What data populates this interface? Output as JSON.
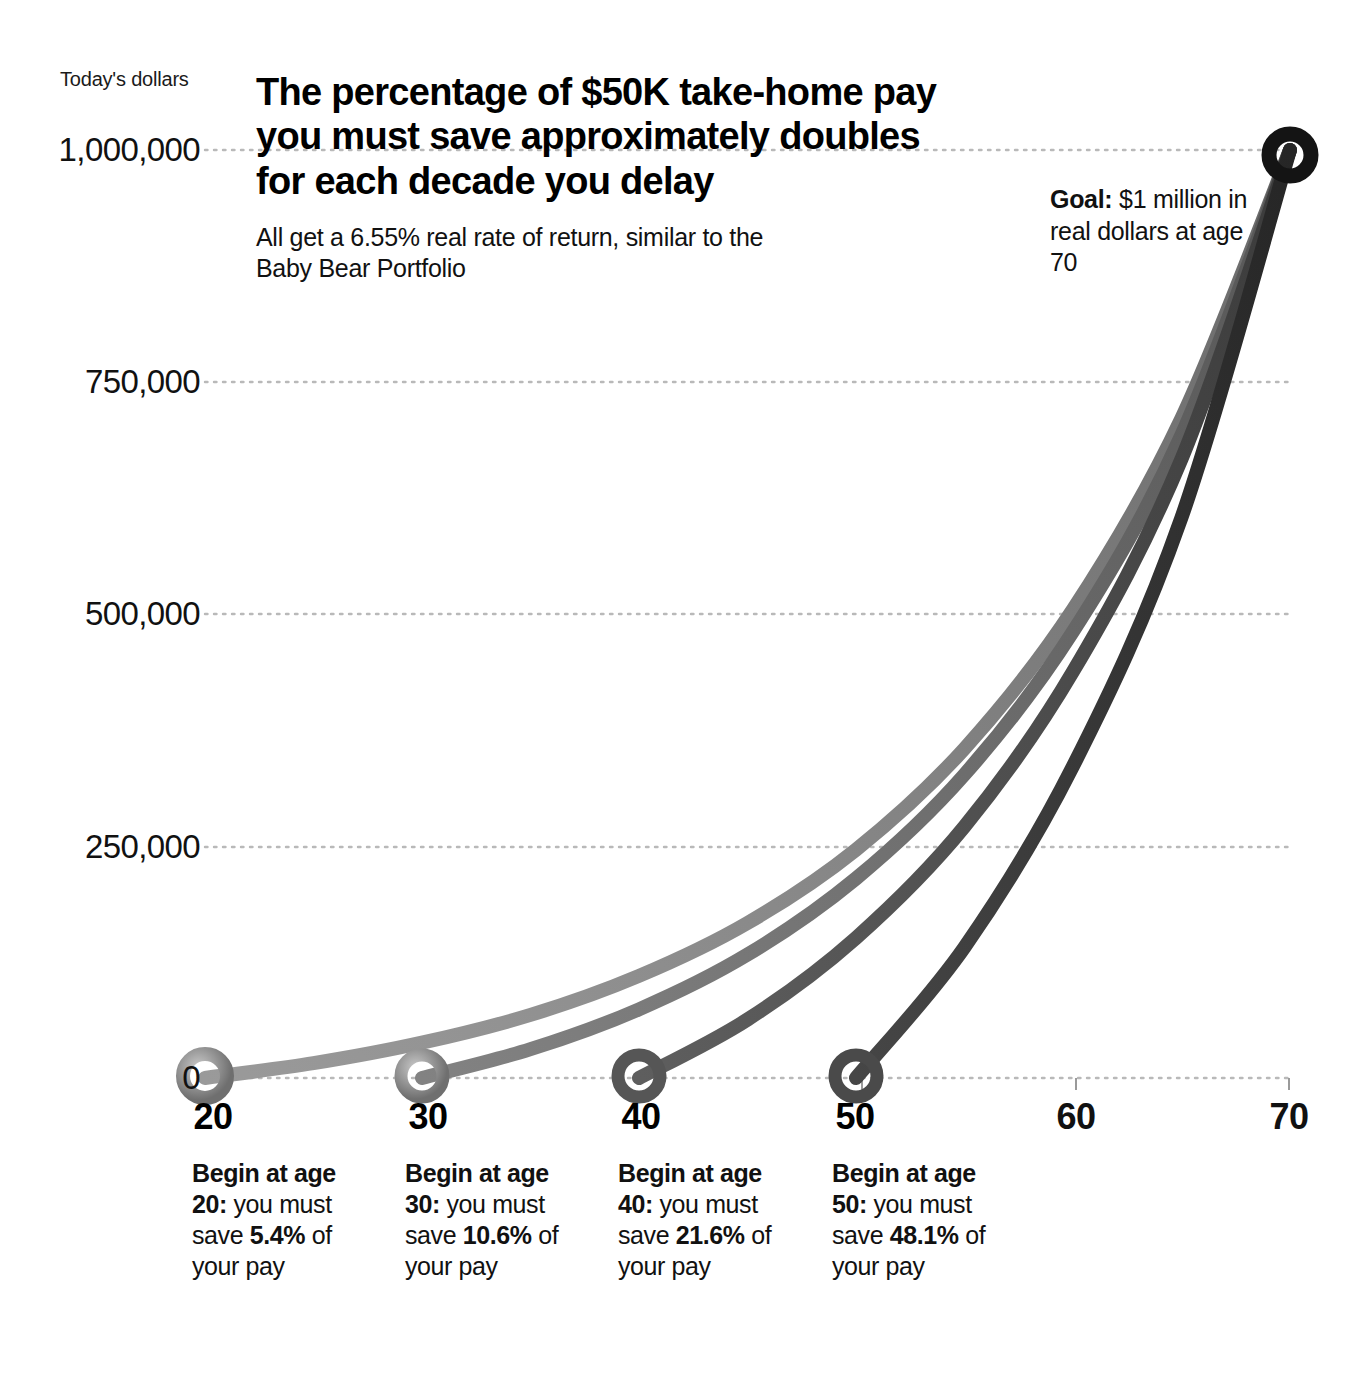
{
  "axis_caption": "Today's dollars",
  "title": "The percentage of $50K take-home pay you must save approximately doubles for each decade you delay",
  "subtitle": "All get a 6.55% real rate of return, similar to the Baby Bear Portfolio",
  "goal_note": {
    "label": "Goal:",
    "text": " $1 million in real dollars at age 70"
  },
  "notes": [
    {
      "lead": "Begin at age 20:",
      "mid": " you must save ",
      "pct": "5.4%",
      "tail": " of your pay"
    },
    {
      "lead": "Begin at age 30:",
      "mid": " you must save ",
      "pct": "10.6%",
      "tail": " of your pay"
    },
    {
      "lead": "Begin at age 40:",
      "mid": " you must save ",
      "pct": "21.6%",
      "tail": " of your pay"
    },
    {
      "lead": "Begin at age 50:",
      "mid": " you must save ",
      "pct": "48.1%",
      "tail": " of your pay"
    }
  ],
  "chart_data": {
    "type": "line",
    "title": "The percentage of $50K take-home pay you must save approximately doubles for each decade you delay",
    "subtitle": "All get a 6.55% real rate of return, similar to the Baby Bear Portfolio",
    "xlabel": "",
    "ylabel": "Today's dollars",
    "xlim": [
      20,
      70
    ],
    "ylim": [
      0,
      1000000
    ],
    "grid": true,
    "legend": "none",
    "annotation": "Goal: $1 million in real dollars at age 70",
    "rate_of_return_pct": 6.55,
    "take_home_pay": 50000,
    "goal_value": 1000000,
    "goal_age": 70,
    "xticks": [
      20,
      30,
      40,
      50,
      60,
      70
    ],
    "xticklabels": [
      "20",
      "30",
      "40",
      "50",
      "60",
      "70"
    ],
    "yticks": [
      0,
      250000,
      500000,
      750000,
      1000000
    ],
    "yticklabels": [
      "0",
      "250,000",
      "500,000",
      "750,000",
      "1,000,000"
    ],
    "series": [
      {
        "name": "Begin at age 20",
        "start_age": 20,
        "savings_rate_pct": 5.4,
        "color": "#8d8d8d",
        "x": [
          20,
          25,
          30,
          35,
          40,
          45,
          50,
          55,
          60,
          65,
          70
        ],
        "values": [
          0,
          16000,
          38000,
          68000,
          110000,
          167000,
          246000,
          355000,
          505000,
          711000,
          1000000
        ]
      },
      {
        "name": "Begin at age 30",
        "start_age": 30,
        "savings_rate_pct": 10.6,
        "color": "#6e6e6e",
        "x": [
          30,
          35,
          40,
          45,
          50,
          55,
          60,
          65,
          70
        ],
        "values": [
          0,
          31000,
          74000,
          133000,
          215000,
          327000,
          481000,
          693000,
          1000000
        ]
      },
      {
        "name": "Begin at age 40",
        "start_age": 40,
        "savings_rate_pct": 21.6,
        "color": "#4f4f4f",
        "x": [
          40,
          45,
          50,
          55,
          60,
          65,
          70
        ],
        "values": [
          0,
          63000,
          151000,
          271000,
          438000,
          667000,
          1000000
        ]
      },
      {
        "name": "Begin at age 50",
        "start_age": 50,
        "savings_rate_pct": 48.1,
        "color": "#3a3a3a",
        "x": [
          50,
          55,
          60,
          65,
          70
        ],
        "values": [
          0,
          141000,
          336000,
          604000,
          1000000
        ]
      }
    ],
    "markers": [
      {
        "name": "start-marker-20",
        "age": 20,
        "value": 0,
        "style": "ring",
        "color": "#8d8d8d"
      },
      {
        "name": "start-marker-30",
        "age": 30,
        "value": 0,
        "style": "ring",
        "color": "#6e6e6e"
      },
      {
        "name": "start-marker-40",
        "age": 40,
        "value": 0,
        "style": "ring",
        "color": "#4f4f4f"
      },
      {
        "name": "start-marker-50",
        "age": 50,
        "value": 0,
        "style": "ring",
        "color": "#3a3a3a"
      },
      {
        "name": "goal-marker-70",
        "age": 70,
        "value": 1000000,
        "style": "ring",
        "color": "#111111"
      }
    ]
  }
}
